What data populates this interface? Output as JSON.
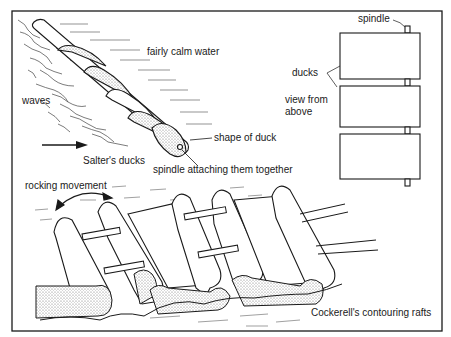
{
  "figure": {
    "caption_partial": "Fig. — Salter's ducks and Cockerell's rafts",
    "colors": {
      "ink": "#1a1a1a",
      "stipple": "#c8c8c8",
      "background": "#ffffff"
    }
  },
  "salters_ducks": {
    "title": "Salter's ducks",
    "labels": {
      "calm": "fairly calm water",
      "waves": "waves",
      "shape": "shape of duck",
      "spindle_attach": "spindle attaching them together"
    },
    "arrow_direction": "right"
  },
  "top_view": {
    "labels": {
      "spindle": "spindle",
      "ducks": "ducks",
      "view_line1": "view from",
      "view_line2": "above"
    },
    "duck_count": 3
  },
  "cockerell_rafts": {
    "title": "Cockerell's contouring rafts",
    "labels": {
      "rocking": "rocking movement"
    }
  }
}
